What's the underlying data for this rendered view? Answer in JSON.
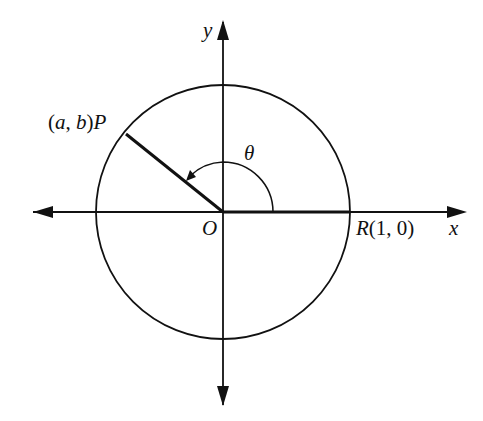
{
  "diagram": {
    "type": "unit-circle-angle",
    "labels": {
      "y_axis": "y",
      "x_axis": "x",
      "origin": "O",
      "angle": "θ",
      "point_p": "(a, b)P",
      "point_r": "R(1, 0)"
    },
    "geometry": {
      "origin": [
        223,
        212
      ],
      "radius": 127,
      "point_p": [
        126,
        134
      ],
      "point_r": [
        350,
        212
      ],
      "angle_arc_radius": 50
    },
    "colors": {
      "stroke": "#111111",
      "background": "#ffffff"
    }
  }
}
